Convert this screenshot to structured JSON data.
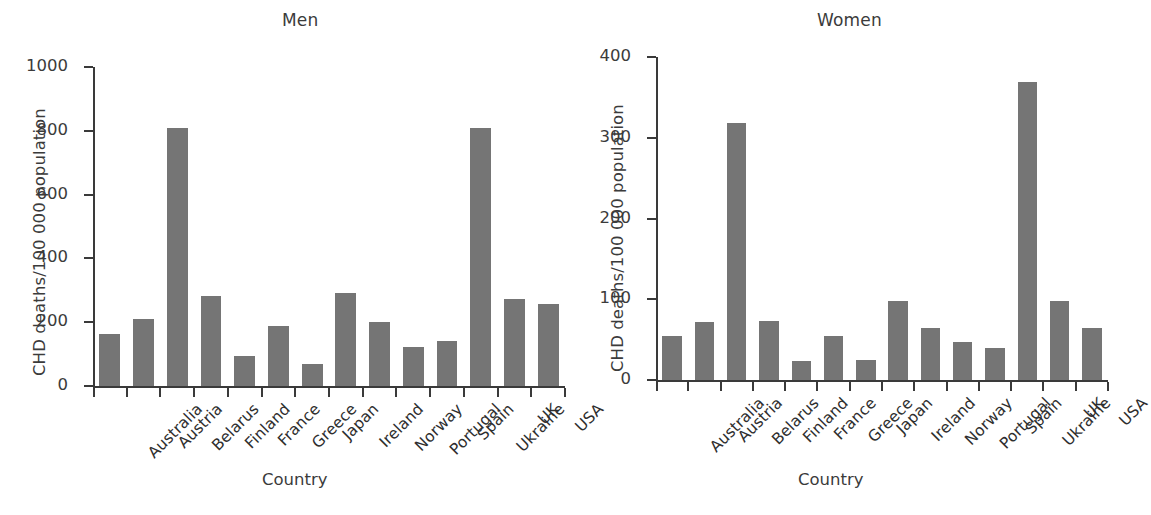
{
  "chart_data": [
    {
      "type": "bar",
      "title": "Men",
      "xlabel": "Country",
      "ylabel": "CHD deaths/100 000 population",
      "ylim": [
        0,
        1000
      ],
      "yticks": [
        0,
        200,
        400,
        600,
        800,
        1000
      ],
      "grid": false,
      "legend": null,
      "bar_color": "#757575",
      "categories": [
        "Australia",
        "Austria",
        "Belarus",
        "Finland",
        "France",
        "Greece",
        "Japan",
        "Ireland",
        "Norway",
        "Portugal",
        "Spain",
        "Ukraine",
        "UK",
        "USA"
      ],
      "values": [
        163,
        210,
        810,
        283,
        93,
        188,
        70,
        291,
        202,
        122,
        141,
        808,
        272,
        256
      ]
    },
    {
      "type": "bar",
      "title": "Women",
      "xlabel": "Country",
      "ylabel": "CHD deaths/100 000 population",
      "ylim": [
        0,
        400
      ],
      "yticks": [
        0,
        100,
        200,
        300,
        400
      ],
      "grid": false,
      "legend": null,
      "bar_color": "#757575",
      "categories": [
        "Australia",
        "Austria",
        "Belarus",
        "Finland",
        "France",
        "Greece",
        "Japan",
        "Ireland",
        "Norway",
        "Portugal",
        "Spain",
        "Ukraine",
        "UK",
        "USA"
      ],
      "values": [
        55,
        72,
        318,
        73,
        24,
        54,
        25,
        98,
        64,
        47,
        40,
        369,
        98,
        65
      ]
    }
  ]
}
